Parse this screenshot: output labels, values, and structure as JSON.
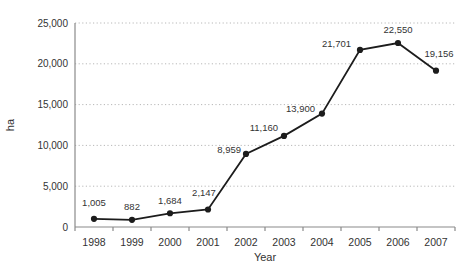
{
  "chart_data": {
    "type": "line",
    "title": "",
    "xlabel": "Year",
    "ylabel": "ha",
    "categories": [
      "1998",
      "1999",
      "2000",
      "2001",
      "2002",
      "2003",
      "2004",
      "2005",
      "2006",
      "2007"
    ],
    "series": [
      {
        "name": "ha",
        "values": [
          1005,
          882,
          1684,
          2147,
          8959,
          11160,
          13900,
          21701,
          22550,
          19156
        ],
        "point_labels": [
          "1,005",
          "882",
          "1,684",
          "2,147",
          "8,959",
          "11,160",
          "13,900",
          "21,701",
          "22,550",
          "19,156"
        ]
      }
    ],
    "label_placement": [
      {
        "anchor": "middle",
        "dx": 0,
        "dy": -13
      },
      {
        "anchor": "middle",
        "dx": 0,
        "dy": -10
      },
      {
        "anchor": "middle",
        "dx": 0,
        "dy": -9
      },
      {
        "anchor": "middle",
        "dx": -4,
        "dy": -13
      },
      {
        "anchor": "end",
        "dx": -5,
        "dy": -1
      },
      {
        "anchor": "end",
        "dx": -6,
        "dy": -5
      },
      {
        "anchor": "end",
        "dx": -7,
        "dy": -2
      },
      {
        "anchor": "end",
        "dx": -9,
        "dy": -3
      },
      {
        "anchor": "middle",
        "dx": 0,
        "dy": -10
      },
      {
        "anchor": "middle",
        "dx": 3,
        "dy": -14
      }
    ],
    "ylim": [
      0,
      25000
    ],
    "ytick_step": 5000,
    "ytick_labels": [
      "0",
      "5,000",
      "10,000",
      "15,000",
      "20,000",
      "25,000"
    ],
    "grid": "horizontal-dotted",
    "legend": "none",
    "colors": {
      "line": "#1c1c1c",
      "marker": "#1c1c1c",
      "grid": "#b8b8b8",
      "axis": "#8a8a8a",
      "text": "#333333"
    }
  }
}
